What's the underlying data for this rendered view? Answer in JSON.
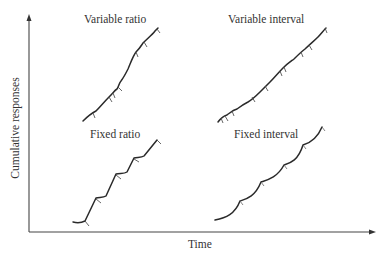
{
  "axes": {
    "x_label": "Time",
    "y_label": "Cumulative responses"
  },
  "panels": [
    {
      "id": "variable-ratio",
      "title": "Variable ratio"
    },
    {
      "id": "variable-interval",
      "title": "Variable interval"
    },
    {
      "id": "fixed-ratio",
      "title": "Fixed ratio"
    },
    {
      "id": "fixed-interval",
      "title": "Fixed interval"
    }
  ],
  "colors": {
    "line": "#2a2a2a",
    "axis": "#444444",
    "background": "#ffffff"
  }
}
